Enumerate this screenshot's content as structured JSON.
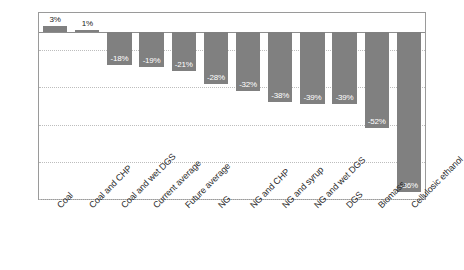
{
  "chart_data": {
    "type": "bar",
    "title": "",
    "subtitle": "",
    "xlabel": "",
    "ylabel": "",
    "ylim": [
      -90,
      10
    ],
    "ytick_labels": [
      "10%",
      "-10%",
      "-30%",
      "-50%",
      "-70%",
      "-90%"
    ],
    "ytick_values": [
      10,
      -10,
      -30,
      -50,
      -70,
      -90
    ],
    "grid": true,
    "legend": "none",
    "bar_color": "#808080",
    "categories": [
      "Coal",
      "Coal and CHP",
      "Coal and wet DGS",
      "Current average",
      "Future average",
      "NG",
      "NG and CHP",
      "NG and syrup",
      "NG and wet DGS",
      "DGS",
      "Biomass",
      "Cellulosic ethanol"
    ],
    "values": [
      3,
      1,
      -18,
      -19,
      -21,
      -28,
      -32,
      -38,
      -39,
      -39,
      -52,
      -86
    ],
    "data_labels": [
      "3%",
      "1%",
      "-18%",
      "-19%",
      "-21%",
      "-28%",
      "-32%",
      "-38%",
      "-39%",
      "-39%",
      "-52%",
      "-86%"
    ]
  }
}
